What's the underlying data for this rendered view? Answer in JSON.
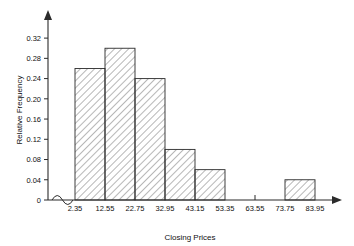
{
  "chart_data": {
    "type": "bar",
    "title": "",
    "subtitle": "",
    "xlabel": "Closing Prices",
    "ylabel": "Relative Frequency",
    "grid": false,
    "legend": null,
    "bin_width": 10.2,
    "bin_edges": [
      2.35,
      12.55,
      22.75,
      32.95,
      43.15,
      53.35,
      63.55,
      73.75,
      83.95
    ],
    "categories": [
      "2.35-12.55",
      "12.55-22.75",
      "22.75-32.95",
      "32.95-43.15",
      "43.15-53.35",
      "53.35-63.55",
      "63.55-73.75",
      "73.75-83.95"
    ],
    "values": [
      0.26,
      0.3,
      0.24,
      0.1,
      0.06,
      0,
      0,
      0.04
    ],
    "xlim": [
      2.35,
      83.95
    ],
    "ylim": [
      0,
      0.34
    ],
    "x_tick_labels": [
      "2.35",
      "12.55",
      "22.75",
      "32.95",
      "43.15",
      "53.35",
      "63.55",
      "73.75",
      "83.95"
    ],
    "y_tick_labels": [
      "0",
      "0.04",
      "0.08",
      "0.12",
      "0.16",
      "0.20",
      "0.24",
      "0.28",
      "0.32"
    ],
    "y_tick_values": [
      0,
      0.04,
      0.08,
      0.12,
      0.16,
      0.2,
      0.24,
      0.28,
      0.32
    ],
    "axis_break": true,
    "colors": {
      "axis": "#2b2b2b",
      "bar_edge": "#2b2b2b",
      "bar_fill": "#ffffff",
      "hatch": "#555555",
      "background": "#ffffff"
    }
  }
}
